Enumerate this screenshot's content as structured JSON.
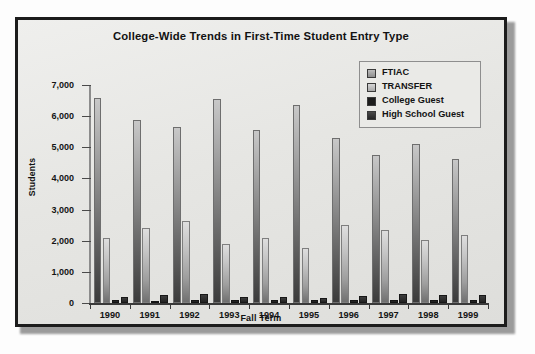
{
  "chart_data": {
    "type": "bar",
    "title": "College-Wide Trends in First-Time Student Entry  Type",
    "xlabel": "Fall Term",
    "ylabel": "Students",
    "categories": [
      "1990",
      "1991",
      "1992",
      "1993",
      "1994",
      "1995",
      "1996",
      "1997",
      "1998",
      "1999"
    ],
    "ylim": [
      0,
      7000
    ],
    "ytick_labels": [
      "0",
      "1,000",
      "2,000",
      "3,000",
      "4,000",
      "5,000",
      "6,000",
      "7,000"
    ],
    "ytick_values": [
      0,
      1000,
      2000,
      3000,
      4000,
      5000,
      6000,
      7000
    ],
    "grid": false,
    "legend_position": "top-right",
    "series": [
      {
        "name": "FTIAC",
        "color": "#8d8d8d",
        "values": [
          6570,
          5880,
          5650,
          6560,
          5560,
          6350,
          5300,
          4750,
          5120,
          4610
        ]
      },
      {
        "name": "TRANSFER",
        "color": "#c0c0c0",
        "values": [
          2080,
          2400,
          2620,
          1900,
          2080,
          1760,
          2500,
          2340,
          2010,
          2190
        ]
      },
      {
        "name": "College Guest",
        "color": "#1d1d1d",
        "values": [
          90,
          80,
          110,
          90,
          110,
          90,
          110,
          110,
          100,
          100
        ]
      },
      {
        "name": "High School Guest",
        "color": "#303030",
        "values": [
          180,
          260,
          290,
          180,
          200,
          170,
          240,
          290,
          260,
          250
        ]
      }
    ]
  }
}
